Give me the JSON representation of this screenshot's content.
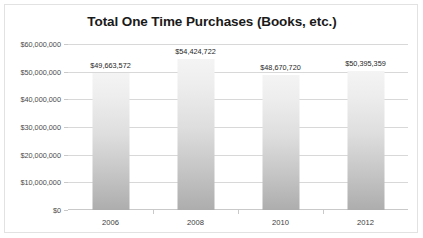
{
  "chart_data": {
    "type": "bar",
    "title": "Total One Time Purchases (Books, etc.)",
    "xlabel": "",
    "ylabel": "",
    "categories": [
      "2006",
      "2008",
      "2010",
      "2012"
    ],
    "values": [
      49663572,
      54424722,
      48670720,
      50395359
    ],
    "data_labels": [
      "$49,663,572",
      "$54,424,722",
      "$48,670,720",
      "$50,395,359"
    ],
    "ylim": [
      0,
      60000000
    ],
    "ytick_values": [
      0,
      10000000,
      20000000,
      30000000,
      40000000,
      50000000,
      60000000
    ],
    "ytick_labels": [
      "$0",
      "$10,000,000",
      "$20,000,000",
      "$30,000,000",
      "$40,000,000",
      "$50,000,000",
      "$60,000,000"
    ],
    "grid": true,
    "legend": false,
    "series": [
      {
        "name": "Total One Time Purchases",
        "values": [
          49663572,
          54424722,
          48670720,
          50395359
        ]
      }
    ],
    "colors": {
      "bar_top": "#f4f4f4",
      "bar_bottom": "#adadad",
      "gridline": "#d8d8d8",
      "axis": "#c9c9c9",
      "title_text": "#1a1a1a",
      "tick_text": "#4a4a4a",
      "border": "#e2e2e2",
      "background": "#ffffff"
    }
  }
}
